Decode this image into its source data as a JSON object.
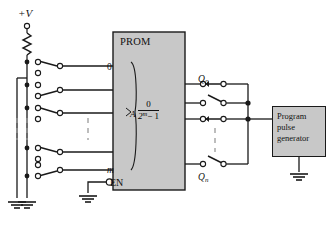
{
  "figure": {
    "type": "schematic-circuit-diagram"
  },
  "supply": {
    "label": "+V",
    "terminal_icon": "open-circle-terminal",
    "resistor_icon": "zigzag-resistor"
  },
  "prom": {
    "title": "PROM",
    "address_top": "0",
    "address_bottom": "m",
    "address_group_label": "A",
    "data_range_numerator": "0",
    "data_range_denominator_base": "2",
    "data_range_denominator_exp": "m",
    "data_range_denominator_tail": "− 1",
    "enable_label": "EN",
    "enable_bubble_icon": "inverting-bubble",
    "fill_color": "#c8c8c8",
    "border_color": "#1a1a1a"
  },
  "outputs": {
    "top_label": "Q",
    "top_sub": "0",
    "bottom_label": "Q",
    "bottom_sub": "n"
  },
  "program_pulse_generator": {
    "line1": "Program",
    "line2": "pulse",
    "line3": "generator",
    "fill_color": "#c8c8c8",
    "border_color": "#1a1a1a",
    "ground_icon": "ground-symbol"
  },
  "symbols": {
    "switch": "spdt-toggle-switch",
    "node": "filled-junction-dot",
    "terminal": "open-circle-terminal",
    "ground": "ground-symbol",
    "ellipsis": "vertical-dashed-ellipsis"
  },
  "colors": {
    "wire": "#1a1a1a",
    "box_fill": "#c8c8c8",
    "background": "#ffffff",
    "dashed": "#9a9a9a"
  }
}
